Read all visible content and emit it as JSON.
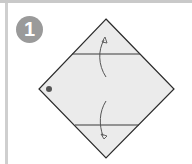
{
  "step": {
    "number": "1",
    "badge_color": "#9a9a9a"
  },
  "diagram": {
    "shape": "diamond",
    "paper_color": "#ebebeb",
    "line_color": "#2b2b2b",
    "dot_color": "#555555",
    "folds": [
      {
        "name": "upper-fold-line",
        "direction": "fold top corner down"
      },
      {
        "name": "lower-fold-line",
        "direction": "fold bottom corner up"
      }
    ]
  }
}
